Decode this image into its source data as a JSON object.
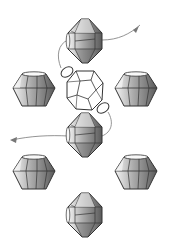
{
  "diagram": {
    "type": "beading-pattern",
    "colors": {
      "background": "#ffffff",
      "outline": "#333333",
      "thread": "#888888",
      "bead_light": "#f2f2f2",
      "bead_mid": "#b0b0b0",
      "bead_dark": "#6a6a6a"
    },
    "beads": [
      {
        "id": "top",
        "kind": "bicone-vertical",
        "cx": 85,
        "cy": 41
      },
      {
        "id": "mid-left",
        "kind": "bicone-horizontal",
        "cx": 34,
        "cy": 90
      },
      {
        "id": "mid-right",
        "kind": "bicone-horizontal",
        "cx": 136,
        "cy": 90
      },
      {
        "id": "center",
        "kind": "faceted-round",
        "cx": 85,
        "cy": 90
      },
      {
        "id": "seed-upper",
        "kind": "seed",
        "cx": 67,
        "cy": 72
      },
      {
        "id": "seed-lower",
        "kind": "seed",
        "cx": 103,
        "cy": 108
      },
      {
        "id": "lower",
        "kind": "bicone-vertical",
        "cx": 85,
        "cy": 135
      },
      {
        "id": "low-left",
        "kind": "bicone-horizontal",
        "cx": 34,
        "cy": 173
      },
      {
        "id": "low-right",
        "kind": "bicone-horizontal",
        "cx": 136,
        "cy": 173
      },
      {
        "id": "bottom",
        "kind": "bicone-vertical",
        "cx": 85,
        "cy": 215
      }
    ],
    "thread": {
      "entry_arrow": "arrow-in-upper-right",
      "exit_arrow": "arrow-out-left"
    }
  }
}
